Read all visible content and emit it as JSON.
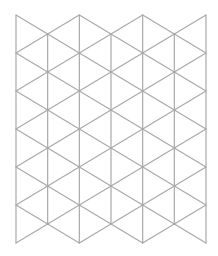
{
  "diagram": {
    "type": "triangular-grid",
    "canvas": {
      "width": 218,
      "height": 256,
      "background": "#ffffff"
    },
    "stroke": {
      "color": "#a9a9a9",
      "width": 1.2
    },
    "grid": {
      "x_start": 16,
      "x_end": 206,
      "columns": 6,
      "y_top": 15,
      "row_period": 38,
      "rows": 6
    }
  }
}
